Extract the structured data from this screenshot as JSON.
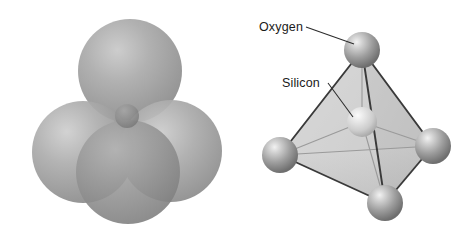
{
  "figure": {
    "background_color": "#ffffff"
  },
  "panels": [
    {
      "id": "space-filling",
      "name": "space-filling-model",
      "description": "Space-filling model of the silicate tetrahedron: four large overlapping oxygen spheres surrounding a small central silicon atom",
      "atoms": [
        {
          "element": "Oxygen",
          "role": "oxygen",
          "cx": 130,
          "cy": 71,
          "r": 52,
          "color": "#9a9a9a"
        },
        {
          "element": "Oxygen",
          "role": "oxygen",
          "cx": 83,
          "cy": 152,
          "r": 51,
          "color": "#9a9a9a"
        },
        {
          "element": "Oxygen",
          "role": "oxygen",
          "cx": 171,
          "cy": 151,
          "r": 51,
          "color": "#9a9a9a"
        },
        {
          "element": "Oxygen",
          "role": "oxygen",
          "cx": 128,
          "cy": 172,
          "r": 52,
          "color": "#8e8e8e"
        },
        {
          "element": "Silicon",
          "role": "silicon",
          "cx": 127,
          "cy": 118,
          "r": 13,
          "color": "#848484"
        }
      ]
    },
    {
      "id": "ball-and-stick",
      "name": "ball-and-stick-model",
      "description": "Ball-and-stick tetrahedron with labelled oxygen and silicon atoms",
      "labels": [
        {
          "text": "Oxygen",
          "x": 19,
          "y": 31,
          "leader_from": [
            66,
            27
          ],
          "leader_to": [
            114,
            44
          ]
        },
        {
          "text": "Silicon",
          "x": 42,
          "y": 87,
          "leader_from": [
            88,
            83
          ],
          "leader_to": [
            113,
            117
          ]
        }
      ],
      "atoms": [
        {
          "element": "Oxygen",
          "role": "oxygen",
          "cx": 122,
          "cy": 50,
          "r": 18,
          "color": "#8f8f8f",
          "position": "top"
        },
        {
          "element": "Oxygen",
          "role": "oxygen",
          "cx": 40,
          "cy": 155,
          "r": 18,
          "color": "#8f8f8f",
          "position": "left"
        },
        {
          "element": "Oxygen",
          "role": "oxygen",
          "cx": 193,
          "cy": 146,
          "r": 18,
          "color": "#8f8f8f",
          "position": "right"
        },
        {
          "element": "Oxygen",
          "role": "oxygen",
          "cx": 145,
          "cy": 203,
          "r": 18,
          "color": "#8f8f8f",
          "position": "bottom"
        },
        {
          "element": "Silicon",
          "role": "silicon",
          "cx": 122,
          "cy": 122,
          "r": 15,
          "color": "#c8c8c8",
          "position": "center"
        }
      ],
      "faces": [
        {
          "name": "front-left-face",
          "fill": "#d6d6d6"
        },
        {
          "name": "front-right-face",
          "fill": "#bdbdbd"
        },
        {
          "name": "bottom-face",
          "fill": "#cecece"
        }
      ]
    }
  ],
  "colors": {
    "background": "#ffffff",
    "oxygen_sphere": "#9a9a9a",
    "silicon_sphere": "#c8c8c8",
    "edge_stroke": "#3a3a3a",
    "leader_stroke": "#2b2b2b",
    "label_text": "#1a1a1a"
  }
}
